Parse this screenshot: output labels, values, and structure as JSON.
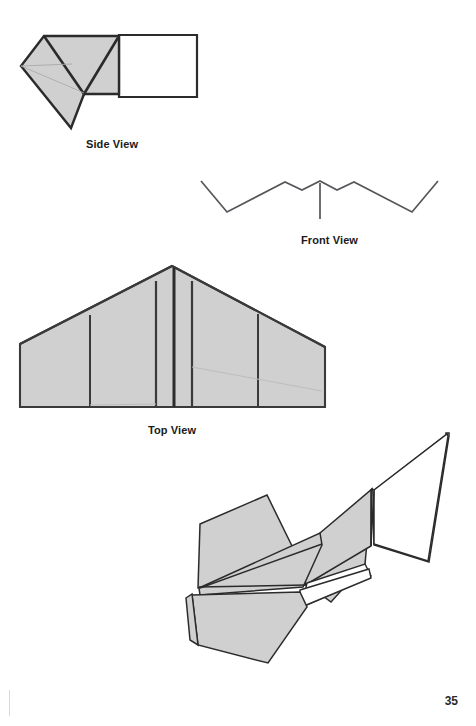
{
  "page": {
    "number": "35",
    "background_color": "#ffffff",
    "ink_color": "#2b2b2b",
    "fill_color": "#d0d0d0",
    "faint_line_color": "#9a9a9a"
  },
  "captions": {
    "side_view": "Side View",
    "front_view": "Front View",
    "top_view": "Top View"
  },
  "figures": [
    {
      "id": "side-view",
      "name": "side-view-diagram",
      "caption": "Side View",
      "description": "Folded paper airplane seen from the side: a shaded nose/wing-fold region with a white rectangular tail panel."
    },
    {
      "id": "front-view",
      "name": "front-view-diagram",
      "caption": "Front View",
      "description": "Zig-zag outline of wing dihedral with a short vertical fuselage stem at center."
    },
    {
      "id": "top-view",
      "name": "top-view-diagram",
      "caption": "Top View",
      "description": "Shaded delta planform with swept leading edges, four vertical crease lines and a flat trailing edge."
    },
    {
      "id": "perspective-view",
      "name": "perspective-view-diagram",
      "caption": "",
      "description": "Three-quarter perspective of the finished paper airplane with shaded wing panels and a white upright fin."
    }
  ]
}
